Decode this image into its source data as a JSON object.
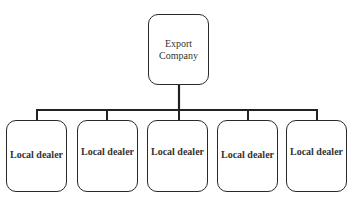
{
  "root": {
    "label_line1": "Export",
    "label_line2": "Company"
  },
  "children": [
    {
      "label": "Local dealer"
    },
    {
      "label": "Local dealer"
    },
    {
      "label": "Local dealer"
    },
    {
      "label": "Local dealer"
    },
    {
      "label": "Local dealer"
    }
  ]
}
